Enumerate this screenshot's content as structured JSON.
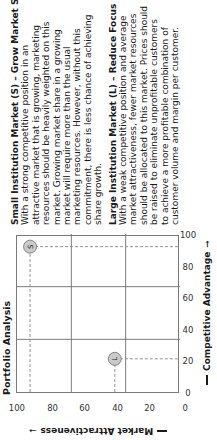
{
  "chart_data": {
    "type": "scatter",
    "title": "Portfolio Analysis",
    "xlabel": "Competitive Advantage",
    "ylabel": "Market Attractiveness",
    "xlim": [
      0,
      100
    ],
    "ylim": [
      0,
      100
    ],
    "x_ticks": [
      "0",
      "20",
      "40",
      "60",
      "80",
      "100"
    ],
    "y_ticks": [
      "100",
      "80",
      "60",
      "40",
      "20",
      "0"
    ],
    "grid": "3x3 quadrant lines at ~33.3 and ~66.7",
    "legend": "none",
    "points": [
      {
        "label": "S",
        "name": "Small Institution Market",
        "x": 92,
        "y": 92
      },
      {
        "label": "L",
        "name": "Large Institution Market",
        "x": 21,
        "y": 40
      }
    ],
    "bubble_color": "#c9c9c9",
    "projection_lines": "dashed from each point to both axes"
  },
  "chart": {
    "title": "Portfolio Analysis",
    "xlabel": "Competitive Advantage",
    "ylabel": "Market Attractiveness",
    "arrow_x": "➞",
    "arrow_y": "➞"
  },
  "sections": [
    {
      "title": "Small Institution Market (S) – Grow Market Share",
      "lines": [
        "With a strong competitive position in an",
        "attractive market that is growing, marketing",
        "resources should be heavily weighted on this",
        "market.  Growing market share in a growing",
        "market will require more than the usual",
        "marketing resources.  However, without this",
        "commitment, there is less chance of achieving",
        "share growth."
      ]
    },
    {
      "title": "Large Institution Market (L) – Reduce Focus",
      "lines": [
        "With a weak competitive position and average",
        "market attractiveness, fewer market resources",
        "should be allocated to this market.  Prices should",
        "be raised  to eliminate unprofitable customers",
        "to achieve a more profitable combination of",
        "customer volume and margin per customer."
      ]
    }
  ]
}
